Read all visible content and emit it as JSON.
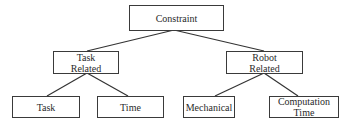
{
  "diagram": {
    "type": "tree",
    "root": {
      "id": "constraint",
      "label": "Constraint",
      "children": [
        {
          "id": "task-related",
          "label": "Task Related",
          "lines": [
            "Task",
            "Related"
          ],
          "children": [
            {
              "id": "task",
              "label": "Task",
              "lines": [
                "Task"
              ]
            },
            {
              "id": "time",
              "label": "Time",
              "lines": [
                "Time"
              ]
            }
          ]
        },
        {
          "id": "robot-related",
          "label": "Robot Related",
          "lines": [
            "Robot",
            "Related"
          ],
          "children": [
            {
              "id": "mechanical",
              "label": "Mechanical",
              "lines": [
                "Mechanical"
              ]
            },
            {
              "id": "computation-time",
              "label": "Computation Time",
              "lines": [
                "Computation",
                "Time"
              ]
            }
          ]
        }
      ]
    },
    "nodes": {
      "constraint": {
        "label": "Constraint"
      },
      "task_related": {
        "line1": "Task",
        "line2": "Related"
      },
      "robot_related": {
        "line1": "Robot",
        "line2": "Related"
      },
      "task": {
        "label": "Task"
      },
      "time": {
        "label": "Time"
      },
      "mechanical": {
        "label": "Mechanical"
      },
      "computation_time": {
        "line1": "Computation",
        "line2": "Time"
      }
    },
    "edges": [
      [
        "constraint",
        "task-related"
      ],
      [
        "constraint",
        "robot-related"
      ],
      [
        "task-related",
        "task"
      ],
      [
        "task-related",
        "time"
      ],
      [
        "robot-related",
        "mechanical"
      ],
      [
        "robot-related",
        "computation-time"
      ]
    ]
  }
}
